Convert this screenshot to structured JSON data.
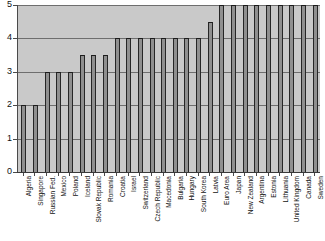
{
  "chart_data": {
    "type": "bar",
    "title": "",
    "subtitle": "",
    "xlabel": "",
    "ylabel": "",
    "ylim": [
      0,
      5
    ],
    "yticks": [
      0,
      1,
      2,
      3,
      4,
      5
    ],
    "ytick_labels": [
      "0",
      "1",
      "2",
      "3",
      "4",
      "5"
    ],
    "grid": true,
    "legend": "none",
    "orientation": "vertical",
    "categories": [
      "Algeria",
      "Singapore",
      "Russian Fed.",
      "Mexico",
      "Poland",
      "Iceland",
      "Slovak Republic",
      "Romania",
      "Croatia",
      "Israel",
      "Switzerland",
      "Czech Republic",
      "Macedonia",
      "Bulgaria",
      "Hungary",
      "South Korea",
      "Latvia",
      "Euro Area",
      "Japan",
      "New Zealand",
      "Argentina",
      "Estonia",
      "Lithuania",
      "United Kingdom",
      "Canada",
      "Sweden"
    ],
    "values": [
      2.0,
      2.0,
      3.0,
      3.0,
      3.0,
      3.5,
      3.5,
      3.5,
      4.0,
      4.0,
      4.0,
      4.0,
      4.0,
      4.0,
      4.0,
      4.0,
      4.5,
      5.0,
      5.0,
      5.0,
      5.0,
      5.0,
      5.0,
      5.0,
      5.0,
      5.0
    ],
    "bar_color": "#8f8f8f",
    "bar_edge_color": "#262626",
    "plot_background": "#c9c9c9",
    "grid_color": "#6e6e6e",
    "figure_background": "#ffffff"
  }
}
